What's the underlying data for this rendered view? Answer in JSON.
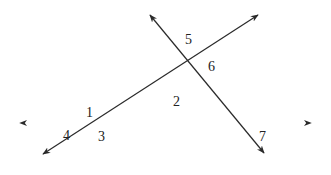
{
  "diagram": {
    "type": "geometry-transversals",
    "colors": {
      "line": "#2a2a2a",
      "horizontal_line_start": "#3a3035",
      "horizontal_line_end": "#4a8a70",
      "label": "#222222"
    },
    "lines": [
      {
        "id": "horizontal",
        "x1": 20,
        "y1": 123,
        "x2": 311,
        "y2": 123,
        "arrows": "both"
      },
      {
        "id": "line-a",
        "x1": 43,
        "y1": 154,
        "x2": 258,
        "y2": 15,
        "arrows": "both"
      },
      {
        "id": "line-b",
        "x1": 150,
        "y1": 15,
        "x2": 264,
        "y2": 153,
        "arrows": "both"
      }
    ],
    "angle_labels": [
      {
        "text": "1",
        "x": 86,
        "y": 117
      },
      {
        "text": "2",
        "x": 173,
        "y": 106
      },
      {
        "text": "3",
        "x": 98,
        "y": 141
      },
      {
        "text": "4",
        "x": 63,
        "y": 140
      },
      {
        "text": "5",
        "x": 185,
        "y": 44
      },
      {
        "text": "6",
        "x": 208,
        "y": 71
      },
      {
        "text": "7",
        "x": 259,
        "y": 141
      }
    ]
  }
}
